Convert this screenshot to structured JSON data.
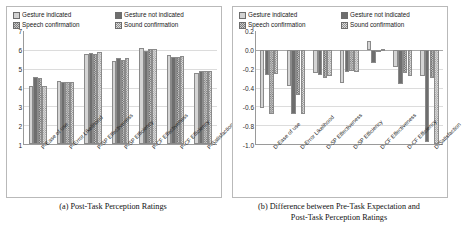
{
  "legend": {
    "items": [
      {
        "label": "Gesture indicated",
        "key": "gesture_indicated",
        "swatch": "light-solid-swatch-icon"
      },
      {
        "label": "Gesture not indicated",
        "key": "gesture_not_indicated",
        "swatch": "dark-solid-swatch-icon"
      },
      {
        "label": "Speech confirmation",
        "key": "speech_confirmation",
        "swatch": "dark-hatch-swatch-icon"
      },
      {
        "label": "Sound confirmation",
        "key": "sound_confirmation",
        "swatch": "light-hatch-swatch-icon"
      }
    ]
  },
  "panel_a": {
    "caption": "(a) Post-Task Perception Ratings"
  },
  "panel_b": {
    "caption_line1": "(b) Difference between Pre-Task Expectation and",
    "caption_line2": "Post-Task Perception Ratings"
  },
  "chart_data": [
    {
      "type": "bar",
      "id": "post-task-perception-ratings",
      "title": "(a) Post-Task Perception Ratings",
      "xlabel": "",
      "ylabel": "",
      "ylim": [
        1,
        7
      ],
      "yticks": [
        7,
        6,
        5,
        4,
        3,
        2,
        1
      ],
      "ytick_labels": [
        "7",
        "6",
        "5",
        "4",
        "3",
        "2",
        "1"
      ],
      "grid": true,
      "legend_position": "top",
      "categories": [
        "P-Ease of use",
        "P-Error Likelihood",
        "P-SP Effectiveness",
        "P-SP Efficiency",
        "P-CF Effectiveness",
        "P-CF Efficiency",
        "P-Satisfaction"
      ],
      "series": [
        {
          "name": "Gesture indicated",
          "values": [
            4.1,
            4.35,
            5.8,
            5.4,
            6.1,
            5.7,
            4.75
          ]
        },
        {
          "name": "Gesture not indicated",
          "values": [
            4.55,
            4.3,
            5.85,
            5.55,
            5.95,
            5.6,
            4.9
          ]
        },
        {
          "name": "Speech confirmation",
          "values": [
            4.5,
            4.3,
            5.8,
            5.45,
            6.05,
            5.6,
            4.9
          ]
        },
        {
          "name": "Sound confirmation",
          "values": [
            4.1,
            4.3,
            5.9,
            5.55,
            6.05,
            5.65,
            4.9
          ]
        }
      ]
    },
    {
      "type": "bar",
      "id": "difference-pre-post-task",
      "title": "(b) Difference between Pre-Task Expectation and Post-Task Perception Ratings",
      "xlabel": "",
      "ylabel": "",
      "ylim": [
        -1.0,
        0.2
      ],
      "yticks": [
        0.2,
        0.0,
        -0.2,
        -0.4,
        -0.6,
        -0.8,
        -1.0
      ],
      "ytick_labels": [
        "0.2",
        "0.0",
        "-0.2",
        "-0.4",
        "-0.6",
        "-0.8",
        "-1.0"
      ],
      "grid": true,
      "legend_position": "top",
      "categories": [
        "D-Ease of use",
        "D-Error Likelihood",
        "D-SP Effectiveness",
        "D-SP Efficiency",
        "D-CF Effectiveness",
        "D-CF Efficiency",
        "D-Satisfaction"
      ],
      "series": [
        {
          "name": "Gesture indicated",
          "values": [
            -0.62,
            -0.38,
            -0.25,
            -0.35,
            0.09,
            -0.18,
            -0.28
          ]
        },
        {
          "name": "Gesture not indicated",
          "values": [
            -0.27,
            -0.68,
            -0.27,
            -0.24,
            -0.14,
            -0.36,
            -0.98
          ]
        },
        {
          "name": "Speech confirmation",
          "values": [
            -0.68,
            -0.48,
            -0.3,
            -0.22,
            -0.02,
            -0.25,
            -0.3
          ]
        },
        {
          "name": "Sound confirmation",
          "values": [
            -0.26,
            -0.68,
            -0.28,
            -0.24,
            0.01,
            -0.28,
            -1.0
          ]
        }
      ]
    }
  ]
}
